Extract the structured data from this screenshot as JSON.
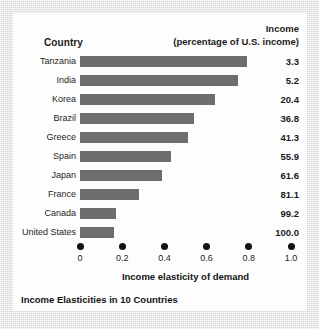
{
  "figure": {
    "caption": "Income Elasticities in 10 Countries",
    "bar_color": "#6e6e6e",
    "tick_color": "#111111",
    "card_background": "#fdfdfd",
    "page_background": "#e8e8e8"
  },
  "headers": {
    "country": "Country",
    "income_line1": "Income",
    "income_line2": "(percentage of U.S. income)"
  },
  "chart_data": {
    "type": "bar",
    "orientation": "horizontal",
    "title": "Income Elasticities in 10 Countries",
    "xlabel": "Income elasticity of demand",
    "ylabel": "Country",
    "xlim": [
      0,
      1.0
    ],
    "xticks": [
      "0",
      "0.2",
      "0.4",
      "0.6",
      "0.8",
      "1.0"
    ],
    "xtick_values": [
      0,
      0.2,
      0.4,
      0.6,
      0.8,
      1.0
    ],
    "grid": false,
    "legend": null,
    "categories": [
      "Tanzania",
      "India",
      "Korea",
      "Brazil",
      "Greece",
      "Spain",
      "Japan",
      "France",
      "Canada",
      "United States"
    ],
    "values": [
      0.79,
      0.75,
      0.64,
      0.54,
      0.51,
      0.43,
      0.39,
      0.28,
      0.17,
      0.16
    ],
    "annotations": {
      "column_header": "Income (percentage of U.S. income)",
      "labels": [
        "3.3",
        "5.2",
        "20.4",
        "36.8",
        "41.3",
        "55.9",
        "61.6",
        "81.1",
        "99.2",
        "100.0"
      ],
      "label_values": [
        3.3,
        5.2,
        20.4,
        36.8,
        41.3,
        55.9,
        61.6,
        81.1,
        99.2,
        100.0
      ]
    },
    "rows": [
      {
        "country": "Tanzania",
        "elasticity": 0.79,
        "income": "3.3"
      },
      {
        "country": "India",
        "elasticity": 0.75,
        "income": "5.2"
      },
      {
        "country": "Korea",
        "elasticity": 0.64,
        "income": "20.4"
      },
      {
        "country": "Brazil",
        "elasticity": 0.54,
        "income": "36.8"
      },
      {
        "country": "Greece",
        "elasticity": 0.51,
        "income": "41.3"
      },
      {
        "country": "Spain",
        "elasticity": 0.43,
        "income": "55.9"
      },
      {
        "country": "Japan",
        "elasticity": 0.39,
        "income": "61.6"
      },
      {
        "country": "France",
        "elasticity": 0.28,
        "income": "81.1"
      },
      {
        "country": "Canada",
        "elasticity": 0.17,
        "income": "99.2"
      },
      {
        "country": "United States",
        "elasticity": 0.16,
        "income": "100.0"
      }
    ]
  }
}
